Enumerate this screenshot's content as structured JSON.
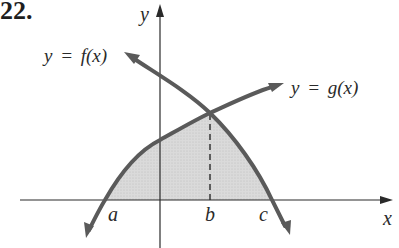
{
  "problem_number": "22.",
  "axes": {
    "x_label": "x",
    "y_label": "y"
  },
  "curves": {
    "f_label": "y = f(x)",
    "g_label": "y = g(x)"
  },
  "points": {
    "a": "a",
    "b": "b",
    "c": "c"
  },
  "colors": {
    "curve": "#5a5a5a",
    "shade": "#d6d6d6",
    "axis": "#2a2a2a"
  }
}
